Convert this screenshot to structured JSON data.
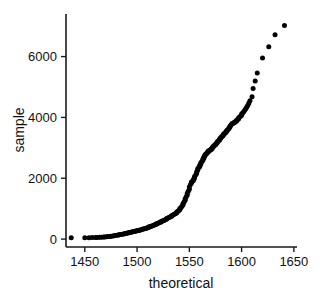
{
  "chart_data": {
    "type": "scatter",
    "title": "",
    "xlabel": "theoretical",
    "ylabel": "sample",
    "xlim": [
      1432,
      1653
    ],
    "ylim": [
      -260,
      7400
    ],
    "xticks": [
      1450,
      1500,
      1550,
      1600,
      1650
    ],
    "xticklabels": [
      "1450",
      "1500",
      "1550",
      "1600",
      "1650"
    ],
    "yticks": [
      0,
      2000,
      4000,
      6000
    ],
    "yticklabels": [
      "0",
      "2000",
      "4000",
      "6000"
    ],
    "grid": false,
    "legend": null,
    "marker": "filled-circle",
    "marker_color": "#000000",
    "marker_size": 5,
    "series": [
      {
        "name": "sample vs theoretical",
        "x": [
          1437,
          1450,
          1454,
          1457,
          1460,
          1462,
          1464,
          1466,
          1468,
          1469,
          1471,
          1472,
          1474,
          1475,
          1477,
          1478,
          1479,
          1481,
          1482,
          1483,
          1484,
          1486,
          1487,
          1488,
          1489,
          1490,
          1491,
          1492,
          1493,
          1494,
          1495,
          1496,
          1497,
          1498,
          1499,
          1500,
          1501,
          1502,
          1503,
          1504,
          1505,
          1506,
          1507,
          1508,
          1509,
          1510,
          1511,
          1511,
          1512,
          1513,
          1514,
          1515,
          1516,
          1517,
          1518,
          1518,
          1519,
          1520,
          1521,
          1522,
          1523,
          1523,
          1524,
          1525,
          1526,
          1527,
          1528,
          1528,
          1529,
          1530,
          1531,
          1532,
          1533,
          1533,
          1534,
          1535,
          1536,
          1537,
          1538,
          1538,
          1539,
          1540,
          1541,
          1541,
          1542,
          1543,
          1544,
          1544,
          1545,
          1546,
          1546,
          1547,
          1548,
          1548,
          1549,
          1550,
          1550,
          1551,
          1552,
          1552,
          1553,
          1554,
          1554,
          1555,
          1555,
          1556,
          1557,
          1557,
          1558,
          1558,
          1559,
          1560,
          1560,
          1561,
          1561,
          1562,
          1563,
          1563,
          1564,
          1564,
          1565,
          1565,
          1566,
          1567,
          1567,
          1568,
          1568,
          1569,
          1569,
          1570,
          1571,
          1571,
          1572,
          1572,
          1573,
          1573,
          1574,
          1575,
          1575,
          1576,
          1576,
          1577,
          1577,
          1578,
          1579,
          1579,
          1580,
          1580,
          1581,
          1582,
          1582,
          1583,
          1583,
          1584,
          1585,
          1585,
          1586,
          1586,
          1587,
          1588,
          1588,
          1589,
          1589,
          1590,
          1591,
          1591,
          1592,
          1593,
          1593,
          1594,
          1595,
          1595,
          1596,
          1597,
          1597,
          1598,
          1599,
          1600,
          1600,
          1601,
          1602,
          1603,
          1604,
          1605,
          1606,
          1607,
          1608,
          1610,
          1611,
          1613,
          1615,
          1620,
          1626,
          1632,
          1641
        ],
        "y": [
          40,
          45,
          48,
          50,
          52,
          55,
          58,
          62,
          66,
          70,
          76,
          82,
          88,
          95,
          102,
          110,
          118,
          126,
          134,
          142,
          150,
          158,
          166,
          174,
          182,
          190,
          198,
          206,
          214,
          222,
          230,
          238,
          246,
          255,
          264,
          273,
          282,
          291,
          300,
          310,
          320,
          330,
          340,
          350,
          360,
          370,
          382,
          394,
          406,
          418,
          430,
          442,
          455,
          468,
          481,
          494,
          508,
          522,
          536,
          550,
          564,
          578,
          592,
          607,
          622,
          637,
          652,
          668,
          684,
          700,
          716,
          733,
          750,
          768,
          786,
          805,
          824,
          845,
          866,
          890,
          915,
          942,
          972,
          1005,
          1042,
          1082,
          1125,
          1172,
          1222,
          1275,
          1330,
          1388,
          1448,
          1510,
          1575,
          1642,
          1712,
          1785,
          1840,
          1875,
          1905,
          1935,
          1970,
          2010,
          2055,
          2105,
          2160,
          2215,
          2265,
          2310,
          2350,
          2390,
          2430,
          2470,
          2510,
          2550,
          2590,
          2630,
          2668,
          2705,
          2740,
          2772,
          2800,
          2825,
          2848,
          2868,
          2885,
          2900,
          2915,
          2930,
          2948,
          2968,
          2990,
          3012,
          3035,
          3058,
          3080,
          3100,
          3120,
          3140,
          3160,
          3180,
          3205,
          3232,
          3260,
          3288,
          3315,
          3342,
          3368,
          3392,
          3415,
          3438,
          3460,
          3482,
          3505,
          3528,
          3552,
          3578,
          3605,
          3632,
          3660,
          3690,
          3722,
          3755,
          3790,
          3800,
          3812,
          3825,
          3840,
          3858,
          3878,
          3900,
          3925,
          3952,
          3980,
          4010,
          4042,
          4075,
          4110,
          4148,
          4190,
          4235,
          4285,
          4340,
          4400,
          4470,
          4550,
          4680,
          4950,
          5200,
          5460,
          5950,
          6320,
          6720,
          7020
        ]
      }
    ]
  },
  "axes": {
    "x_axis_name": "x-axis",
    "y_axis_name": "y-axis"
  }
}
